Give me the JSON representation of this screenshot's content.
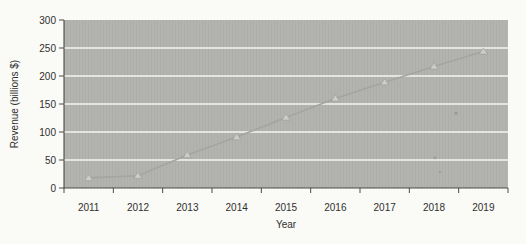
{
  "chart_data": {
    "type": "line",
    "title": "",
    "xlabel": "Year",
    "ylabel": "Revenue (billions $)",
    "categories": [
      "2011",
      "2012",
      "2013",
      "2014",
      "2015",
      "2016",
      "2017",
      "2018",
      "2019"
    ],
    "series": [
      {
        "name": "Revenue",
        "marker": "triangle-up",
        "values": [
          18,
          22,
          59,
          91,
          126,
          160,
          189,
          217,
          244
        ]
      }
    ],
    "ylim": [
      0,
      300
    ],
    "yticks": [
      0,
      50,
      100,
      150,
      200,
      250,
      300
    ],
    "grid": "horizontal-white-gridlines",
    "legend": "none",
    "colors": {
      "page_bg": "#fafaf7",
      "plot_bg": "#b3b3b0",
      "gridline": "#f5f5f2",
      "series_line": "#a4a4a0",
      "marker_fill": "#ccccc8",
      "axis": "#4a4a48",
      "text": "#2f2f2d"
    }
  }
}
